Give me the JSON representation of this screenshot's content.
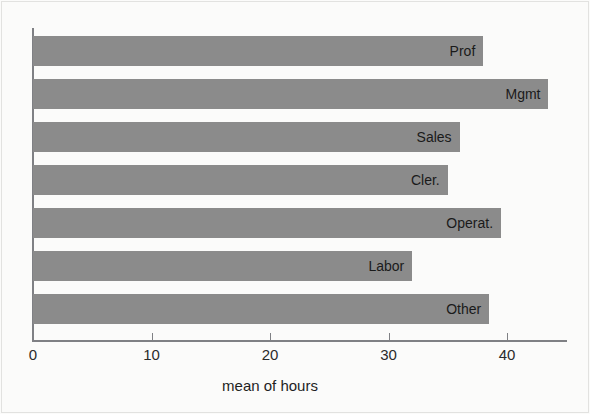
{
  "chart": {
    "type": "barh",
    "title": "",
    "xlabel": "mean of hours",
    "ylabel": "",
    "xlim": [
      0,
      44.8
    ],
    "xticks": [
      "0",
      "10",
      "20",
      "30",
      "40"
    ],
    "xtick_values": [
      0,
      10,
      20,
      30,
      40
    ],
    "grid": false,
    "legend": null,
    "bar_color": "#8b8b8b",
    "axis_color": "#7f8084",
    "background": "#fbfbfa"
  },
  "chart_data": {
    "type": "bar",
    "orientation": "horizontal",
    "title": "",
    "xlabel": "mean of hours",
    "ylabel": "",
    "xlim": [
      0,
      44.8
    ],
    "xticks": [
      0,
      10,
      20,
      30,
      40
    ],
    "grid": false,
    "legend_position": "none",
    "categories": [
      "Prof",
      "Mgmt",
      "Sales",
      "Cler.",
      "Operat.",
      "Labor",
      "Other"
    ],
    "values": [
      38.0,
      43.5,
      36.0,
      35.0,
      39.5,
      32.0,
      38.5
    ],
    "series": [
      {
        "name": "mean of hours",
        "values": [
          38.0,
          43.5,
          36.0,
          35.0,
          39.5,
          32.0,
          38.5
        ],
        "color": "#8b8b8b"
      }
    ],
    "bars": [
      {
        "label": "Prof",
        "value": 38.0
      },
      {
        "label": "Mgmt",
        "value": 43.5
      },
      {
        "label": "Sales",
        "value": 36.0
      },
      {
        "label": "Cler.",
        "value": 35.0
      },
      {
        "label": "Operat.",
        "value": 39.5
      },
      {
        "label": "Labor",
        "value": 32.0
      },
      {
        "label": "Other",
        "value": 38.5
      }
    ]
  }
}
